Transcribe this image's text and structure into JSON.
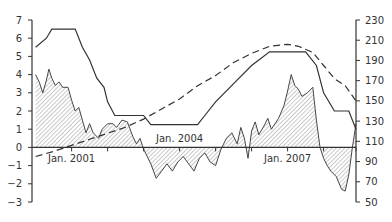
{
  "chart_data": {
    "type": "line",
    "title": "",
    "xlabel": "",
    "ylabel_left": "",
    "ylabel_right": "",
    "x_tick_labels": [
      {
        "label": "Jan. 2001",
        "x_year": 2001.0,
        "position": "below"
      },
      {
        "label": "Jan. 2004",
        "x_year": 2004.0,
        "position": "above"
      },
      {
        "label": "Jan. 2007",
        "x_year": 2007.0,
        "position": "below"
      }
    ],
    "x_range": [
      1999.9,
      2008.9
    ],
    "x_minor_ticks": [
      2001,
      2002,
      2003,
      2004,
      2005,
      2006,
      2007,
      2008,
      2008.9
    ],
    "left_axis": {
      "ticks": [
        7,
        6,
        5,
        4,
        3,
        2,
        1,
        0,
        -1,
        -2,
        -3
      ],
      "ylim": [
        -3,
        7
      ]
    },
    "right_axis": {
      "ticks": [
        230,
        210,
        190,
        170,
        150,
        130,
        110,
        90,
        70,
        50
      ],
      "ylim": [
        50,
        230
      ]
    },
    "grid": false,
    "legend": null,
    "series": [
      {
        "name": "solid-line",
        "axis": "left",
        "style": "solid",
        "points": [
          [
            2000.0,
            5.5
          ],
          [
            2000.3,
            6.0
          ],
          [
            2000.45,
            6.5
          ],
          [
            2000.9,
            6.5
          ],
          [
            2001.1,
            6.5
          ],
          [
            2001.3,
            5.5
          ],
          [
            2001.5,
            4.8
          ],
          [
            2001.7,
            3.8
          ],
          [
            2001.9,
            3.3
          ],
          [
            2002.0,
            2.5
          ],
          [
            2002.2,
            1.75
          ],
          [
            2003.0,
            1.75
          ],
          [
            2003.2,
            1.25
          ],
          [
            2004.5,
            1.25
          ],
          [
            2004.7,
            1.75
          ],
          [
            2005.0,
            2.5
          ],
          [
            2005.5,
            3.5
          ],
          [
            2006.0,
            4.5
          ],
          [
            2006.5,
            5.25
          ],
          [
            2007.5,
            5.25
          ],
          [
            2007.8,
            4.5
          ],
          [
            2008.0,
            3.0
          ],
          [
            2008.3,
            2.0
          ],
          [
            2008.7,
            2.0
          ],
          [
            2008.9,
            1.0
          ]
        ]
      },
      {
        "name": "dashed-line",
        "axis": "right",
        "style": "dashed",
        "points": [
          [
            2000.0,
            95
          ],
          [
            2000.5,
            100
          ],
          [
            2001.0,
            106
          ],
          [
            2001.5,
            112
          ],
          [
            2002.0,
            118
          ],
          [
            2002.5,
            124
          ],
          [
            2003.0,
            132
          ],
          [
            2003.5,
            142
          ],
          [
            2004.0,
            152
          ],
          [
            2004.5,
            165
          ],
          [
            2005.0,
            175
          ],
          [
            2005.5,
            188
          ],
          [
            2006.0,
            197
          ],
          [
            2006.5,
            204
          ],
          [
            2007.0,
            206
          ],
          [
            2007.3,
            204
          ],
          [
            2007.7,
            198
          ],
          [
            2008.0,
            185
          ],
          [
            2008.3,
            172
          ],
          [
            2008.6,
            165
          ],
          [
            2008.9,
            150
          ]
        ]
      },
      {
        "name": "hatched-area",
        "axis": "left",
        "style": "filled-hatched",
        "points": [
          [
            2000.0,
            4.0
          ],
          [
            2000.1,
            3.6
          ],
          [
            2000.2,
            3.0
          ],
          [
            2000.3,
            3.7
          ],
          [
            2000.37,
            4.3
          ],
          [
            2000.45,
            3.8
          ],
          [
            2000.55,
            3.4
          ],
          [
            2000.65,
            3.6
          ],
          [
            2000.75,
            3.3
          ],
          [
            2000.9,
            3.3
          ],
          [
            2001.0,
            2.6
          ],
          [
            2001.1,
            2.0
          ],
          [
            2001.2,
            2.2
          ],
          [
            2001.3,
            1.5
          ],
          [
            2001.4,
            0.8
          ],
          [
            2001.5,
            1.3
          ],
          [
            2001.6,
            0.8
          ],
          [
            2001.75,
            0.5
          ],
          [
            2001.85,
            1.0
          ],
          [
            2002.0,
            1.3
          ],
          [
            2002.15,
            1.3
          ],
          [
            2002.25,
            1.1
          ],
          [
            2002.4,
            1.5
          ],
          [
            2002.55,
            1.4
          ],
          [
            2002.7,
            0.6
          ],
          [
            2002.8,
            0.2
          ],
          [
            2002.9,
            0.5
          ],
          [
            2003.0,
            -0.1
          ],
          [
            2003.2,
            -0.9
          ],
          [
            2003.35,
            -1.7
          ],
          [
            2003.5,
            -1.3
          ],
          [
            2003.65,
            -0.9
          ],
          [
            2003.8,
            -1.3
          ],
          [
            2003.95,
            -0.8
          ],
          [
            2004.1,
            -0.5
          ],
          [
            2004.25,
            -0.9
          ],
          [
            2004.4,
            -1.3
          ],
          [
            2004.55,
            -0.6
          ],
          [
            2004.7,
            -0.3
          ],
          [
            2004.85,
            -0.8
          ],
          [
            2005.0,
            -1.0
          ],
          [
            2005.15,
            -0.1
          ],
          [
            2005.3,
            0.5
          ],
          [
            2005.45,
            0.8
          ],
          [
            2005.6,
            0.2
          ],
          [
            2005.7,
            1.1
          ],
          [
            2005.8,
            0.5
          ],
          [
            2005.9,
            -0.6
          ],
          [
            2006.0,
            0.9
          ],
          [
            2006.1,
            1.4
          ],
          [
            2006.2,
            0.7
          ],
          [
            2006.35,
            1.2
          ],
          [
            2006.45,
            1.6
          ],
          [
            2006.55,
            1.0
          ],
          [
            2006.75,
            1.6
          ],
          [
            2006.9,
            2.3
          ],
          [
            2007.0,
            3.1
          ],
          [
            2007.1,
            4.0
          ],
          [
            2007.2,
            3.4
          ],
          [
            2007.3,
            3.2
          ],
          [
            2007.4,
            2.8
          ],
          [
            2007.55,
            3.0
          ],
          [
            2007.7,
            3.3
          ],
          [
            2007.8,
            1.5
          ],
          [
            2007.9,
            0.0
          ],
          [
            2008.0,
            -0.6
          ],
          [
            2008.1,
            -1.0
          ],
          [
            2008.2,
            -1.3
          ],
          [
            2008.35,
            -1.6
          ],
          [
            2008.5,
            -2.3
          ],
          [
            2008.6,
            -2.4
          ],
          [
            2008.7,
            -1.5
          ],
          [
            2008.8,
            0.0
          ],
          [
            2008.9,
            1.3
          ]
        ]
      }
    ]
  },
  "colors": {
    "line": "#333333",
    "axis": "#333333",
    "hatch": "#666666",
    "background": "#ffffff"
  }
}
